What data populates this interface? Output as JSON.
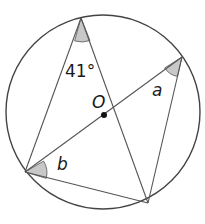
{
  "diagram": {
    "circle": {
      "cx": 103,
      "cy": 112,
      "r": 97,
      "stroke": "#444444"
    },
    "center": {
      "x": 104,
      "y": 115,
      "label": "O"
    },
    "points": {
      "top": {
        "x": 81,
        "y": 18
      },
      "right": {
        "x": 182,
        "y": 57
      },
      "left": {
        "x": 25,
        "y": 172
      },
      "bottom": {
        "x": 148,
        "y": 203
      }
    },
    "angles": {
      "top": {
        "label": "41°"
      },
      "right": {
        "label": "a"
      },
      "left": {
        "label": "b"
      }
    },
    "shade_color": "#c8c8c8",
    "line_color": "#555555"
  }
}
